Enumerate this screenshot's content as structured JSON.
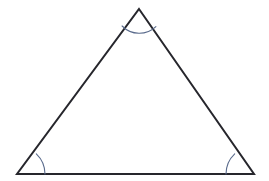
{
  "figure": {
    "title": "Triangle with marked interior angles",
    "type": "geometry-diagram",
    "canvas": {
      "width": 269,
      "height": 181,
      "background_color": "#ffffff"
    },
    "shape": {
      "name": "triangle",
      "label": "triangle",
      "stroke_color": "#26262c",
      "stroke_width": 2,
      "fill": "none",
      "vertices": [
        {
          "name": "apex",
          "label": "apex",
          "x": 139,
          "y": 9
        },
        {
          "name": "bottom-right",
          "label": "bottom right",
          "x": 254,
          "y": 174
        },
        {
          "name": "bottom-left",
          "label": "bottom left",
          "x": 17,
          "y": 174
        }
      ],
      "path": "M 139 9 L 254 174 L 17 174 Z"
    },
    "angle_marks": {
      "stroke_color": "#5a6b8c",
      "stroke_width": 1.1,
      "arcs": [
        {
          "name": "apex-angle-arc",
          "label": "apex angle",
          "vertex": "apex",
          "radius": 24,
          "path": "M 122.1 26.0 A 24 24 0 0 0 155.9 26.6"
        },
        {
          "name": "bottom-left-angle-arc",
          "label": "bottom left angle",
          "vertex": "bottom-left",
          "radius": 28,
          "path": "M 45 174 A 28 28 0 0 0 36.3 153.8"
        },
        {
          "name": "bottom-right-angle-arc",
          "label": "bottom right angle",
          "vertex": "bottom-right",
          "radius": 28,
          "path": "M 234.7 153.8 A 28 28 0 0 0 226 174"
        }
      ]
    }
  }
}
